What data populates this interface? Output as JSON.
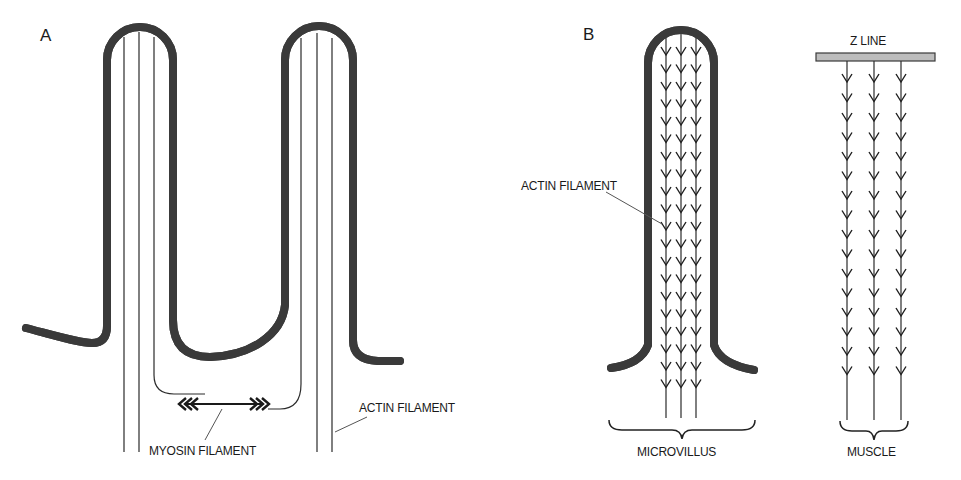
{
  "figure": {
    "panels": [
      {
        "id": "A",
        "label": "A",
        "labels": {
          "myosin": "MYOSIN FILAMENT",
          "actin": "ACTIN FILAMENT"
        },
        "microvilli_count": 2,
        "actin_filaments_per_microvillus": 3
      },
      {
        "id": "B",
        "label": "B",
        "sub_diagrams": [
          {
            "id": "microvillus",
            "caption": "MICROVILLUS",
            "pointer_label": "ACTIN FILAMENT",
            "filament_count": 3,
            "polarity": "barbed ends at tip (arrowheads point toward base)"
          },
          {
            "id": "muscle",
            "caption": "MUSCLE",
            "anchor_label": "Z LINE",
            "filament_count": 3,
            "polarity": "barbed ends at Z line (arrowheads point away from Z line)"
          }
        ]
      }
    ],
    "colors": {
      "line": "#2b2b2b",
      "membrane_fill": "#c6c6c6",
      "zline_fill": "#bdbdbd",
      "background": "#ffffff"
    }
  }
}
